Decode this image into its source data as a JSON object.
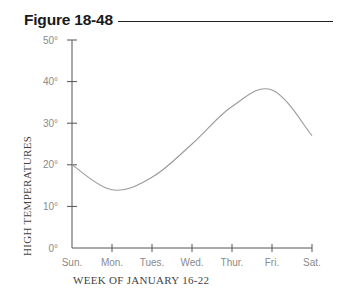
{
  "figure": {
    "title": "Figure 18-48"
  },
  "chart_data": {
    "type": "line",
    "title": "Figure 18-48",
    "xlabel": "WEEK OF JANUARY 16-22",
    "ylabel": "HIGH TEMPERATURES",
    "categories": [
      "Sun.",
      "Mon.",
      "Tues.",
      "Wed.",
      "Thur.",
      "Fri.",
      "Sat."
    ],
    "series": [
      {
        "name": "High temperature",
        "values": [
          20,
          14,
          17,
          25,
          34,
          38,
          27
        ]
      }
    ],
    "yticks": [
      "0°",
      "10°",
      "20°",
      "30°",
      "40°",
      "50°"
    ],
    "ytick_values": [
      0,
      10,
      20,
      30,
      40,
      50
    ],
    "ylim": [
      0,
      50
    ],
    "grid": false,
    "legend": "none",
    "smooth": true
  },
  "colors": {
    "title": "#1a1a1a",
    "axis": "#555555",
    "curve": "#9a9a9a",
    "tick_label": "#8a8a8a"
  }
}
